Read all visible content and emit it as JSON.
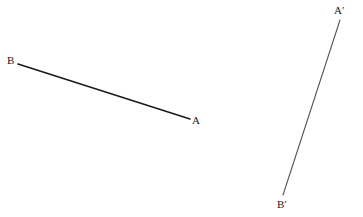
{
  "diagram": {
    "segments": [
      {
        "name": "AB",
        "start": {
          "label": "B",
          "x": 18,
          "y": 64
        },
        "end": {
          "label": "A",
          "x": 190,
          "y": 119
        },
        "color": "#1a1a1a",
        "width": 1.6
      },
      {
        "name": "A'B'",
        "start": {
          "label": "A′",
          "x": 340,
          "y": 20
        },
        "end": {
          "label": "B′",
          "x": 283,
          "y": 195
        },
        "color": "#555555",
        "width": 1.1
      }
    ],
    "labels": {
      "B": "B",
      "A": "A",
      "A_prime": "A′",
      "B_prime": "B′"
    }
  }
}
